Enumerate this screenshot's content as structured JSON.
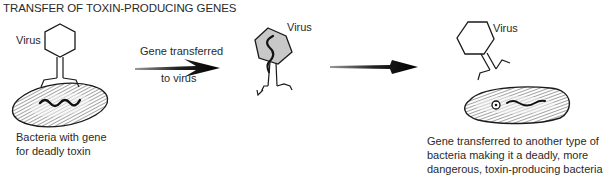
{
  "title": "TRANSFER OF TOXIN-PRODUCING GENES",
  "stage1": {
    "virus_label": "Virus",
    "bacteria_caption_line1": "Bacteria with gene",
    "bacteria_caption_line2": "for deadly toxin"
  },
  "arrow1": {
    "label_top": "Gene transferred",
    "label_bottom": "to virus"
  },
  "stage2": {
    "virus_label": "Virus"
  },
  "stage3": {
    "virus_label": "Virus",
    "caption_line1": "Gene transferred to another type of",
    "caption_line2": "bacteria making it a deadly, more",
    "caption_line3": "dangerous, toxin-producing bacteria"
  },
  "colors": {
    "ink": "#1a1a1a",
    "virus_fill_infected": "#c8c8c8",
    "bacteria_body": "#e8e8e8"
  }
}
